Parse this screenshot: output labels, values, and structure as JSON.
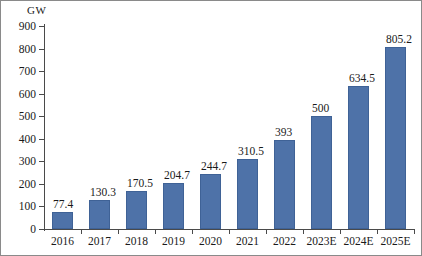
{
  "chart": {
    "unit_label": "GW",
    "bar_color": "#4e72a8",
    "bar_border_color": "#3f6296",
    "axis_color": "#4a4a4a",
    "frame_color": "#8a8a8a"
  },
  "chart_data": {
    "type": "bar",
    "title": "",
    "subtitle": "",
    "xlabel": "",
    "ylabel": "GW",
    "ylim": [
      0,
      900
    ],
    "ytick_step": 100,
    "yticks": [
      0,
      100,
      200,
      300,
      400,
      500,
      600,
      700,
      800,
      900
    ],
    "ytick_labels": [
      "0",
      "100",
      "200",
      "300",
      "400",
      "500",
      "600",
      "700",
      "800",
      "900"
    ],
    "grid": false,
    "legend": null,
    "categories": [
      "2016",
      "2017",
      "2018",
      "2019",
      "2020",
      "2021",
      "2022",
      "2023E",
      "2024E",
      "2025E"
    ],
    "values": [
      77.4,
      130.3,
      170.5,
      204.7,
      244.7,
      310.5,
      393,
      500,
      634.5,
      805.2
    ],
    "value_labels": [
      "77.4",
      "130.3",
      "170.5",
      "204.7",
      "244.7",
      "310.5",
      "393",
      "500",
      "634.5",
      "805.2"
    ]
  }
}
